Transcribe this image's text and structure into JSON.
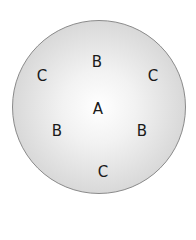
{
  "diagram": {
    "shape": "circle",
    "labels": [
      {
        "id": "b-top",
        "text": "B",
        "x": 97,
        "y": 62
      },
      {
        "id": "c-top-left",
        "text": "C",
        "x": 42,
        "y": 76
      },
      {
        "id": "c-top-right",
        "text": "C",
        "x": 153,
        "y": 76
      },
      {
        "id": "a-center",
        "text": "A",
        "x": 98,
        "y": 109
      },
      {
        "id": "b-left",
        "text": "B",
        "x": 57,
        "y": 131
      },
      {
        "id": "b-right",
        "text": "B",
        "x": 142,
        "y": 131
      },
      {
        "id": "c-bottom",
        "text": "C",
        "x": 103,
        "y": 172
      }
    ]
  }
}
